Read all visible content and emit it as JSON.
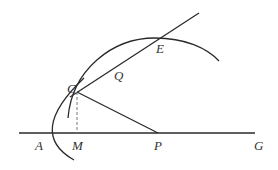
{
  "diagram": {
    "type": "geometry",
    "colors": {
      "stroke": "#2a2a2a",
      "dashed": "#777777",
      "label": "#333333"
    },
    "labels": {
      "A": "A",
      "M": "M",
      "P": "P",
      "G": "G",
      "C": "C",
      "Q": "Q",
      "E": "E"
    },
    "points": {
      "A": [
        44,
        133
      ],
      "M": [
        77,
        133
      ],
      "P": [
        158,
        133
      ],
      "G": [
        255,
        133
      ],
      "C": [
        77,
        92
      ],
      "Q": [
        118,
        65
      ],
      "E": [
        160,
        38
      ]
    },
    "elements": [
      {
        "kind": "line",
        "name": "axis",
        "from": "A",
        "to": "G"
      },
      {
        "kind": "line",
        "name": "secant",
        "through": [
          "C",
          "Q",
          "E"
        ]
      },
      {
        "kind": "segment",
        "name": "CP",
        "from": "C",
        "to": "P"
      },
      {
        "kind": "dashed-segment",
        "name": "CM",
        "from": "C",
        "to": "M"
      },
      {
        "kind": "parabola",
        "name": "parabola",
        "vertex": "A",
        "through": "C"
      },
      {
        "kind": "arc",
        "name": "circle-arc",
        "through": [
          "C",
          "E"
        ]
      }
    ]
  }
}
